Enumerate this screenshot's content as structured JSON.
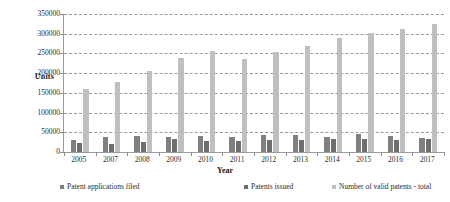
{
  "chart_data": {
    "type": "bar",
    "title": "",
    "xlabel": "Year",
    "ylabel": "Units",
    "ylim": [
      0,
      350000
    ],
    "yticks": [
      "0",
      "50000",
      "100000",
      "150000",
      "200000",
      "250000",
      "300000",
      "350000"
    ],
    "ytick_values": [
      0,
      50000,
      100000,
      150000,
      200000,
      250000,
      300000,
      350000
    ],
    "grid": true,
    "legend_position": "bottom",
    "categories": [
      "2005",
      "2007",
      "2008",
      "2009",
      "2010",
      "2011",
      "2012",
      "2013",
      "2014",
      "2015",
      "2016",
      "2017"
    ],
    "series": [
      {
        "name": "Patent applications filed",
        "color": "#808080",
        "values": [
          30000,
          37500,
          39500,
          37000,
          41000,
          39000,
          42500,
          43000,
          38500,
          44500,
          40000,
          35000
        ]
      },
      {
        "name": "Patents issued",
        "color": "#6e6e6e",
        "values": [
          22000,
          21500,
          26500,
          32500,
          28000,
          27500,
          30500,
          30000,
          32000,
          33000,
          31500,
          32500
        ]
      },
      {
        "name": "Number of valid patents - total",
        "color": "#bfbfbf",
        "values": [
          161000,
          178000,
          205000,
          238000,
          257000,
          235000,
          253000,
          269000,
          290000,
          303000,
          311000,
          324000
        ]
      }
    ]
  }
}
